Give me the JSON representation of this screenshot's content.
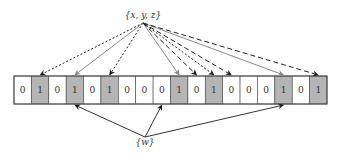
{
  "diagram": {
    "type": "bloom-filter",
    "top_label": "{x, y, z}",
    "bottom_label": "{w}",
    "bits": [
      "0",
      "1",
      "0",
      "1",
      "0",
      "1",
      "0",
      "0",
      "0",
      "1",
      "0",
      "1",
      "0",
      "0",
      "0",
      "1",
      "0",
      "1"
    ],
    "colors": {
      "set_cell": "#b5b5b5",
      "unset_cell": "#ffffff",
      "border": "#444444",
      "dotted_arrow": "#222222",
      "solid_arrow": "#888888",
      "dashed_arrow": "#222222",
      "query_arrow": "#333333"
    },
    "insert_arrows": [
      {
        "element": "x",
        "style": "dotted",
        "targets": [
          1,
          5,
          11
        ]
      },
      {
        "element": "y",
        "style": "solid-gray",
        "targets": [
          3,
          9,
          15
        ]
      },
      {
        "element": "z",
        "style": "dashed",
        "targets": [
          10,
          12,
          17
        ]
      }
    ],
    "query_arrows": [
      {
        "element": "w",
        "style": "solid-dark",
        "targets": [
          3,
          8,
          15
        ]
      }
    ]
  }
}
